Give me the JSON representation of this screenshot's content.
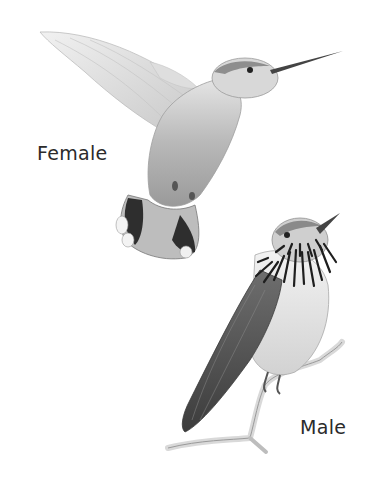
{
  "illustration": {
    "subject": "hummingbirds",
    "style": "pencil drawing",
    "labels": {
      "female": "Female",
      "male": "Male"
    },
    "colors": {
      "background": "#ffffff",
      "text": "#2b2b2b",
      "dark_feather": "#3a3a3a",
      "mid_feather": "#8a8a8a",
      "light_feather": "#d6d6d6"
    }
  }
}
